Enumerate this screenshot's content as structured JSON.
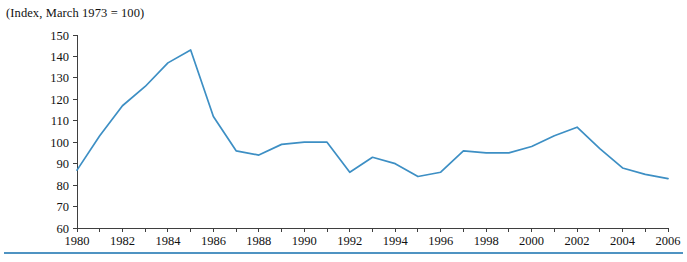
{
  "figure": {
    "title": "(Index, March 1973 = 100)",
    "line_color": "#3d8fc4",
    "rule_color": "#4f93c2",
    "axis_color": "#3f3f3f"
  },
  "chart_data": {
    "type": "line",
    "title": "(Index, March 1973 = 100)",
    "xlabel": "",
    "ylabel": "",
    "xlim": [
      1980,
      2006
    ],
    "ylim": [
      60,
      150
    ],
    "ytick_step": 10,
    "yticks": [
      60,
      70,
      80,
      90,
      100,
      110,
      120,
      130,
      140,
      150
    ],
    "xticks": [
      1980,
      1981,
      1982,
      1983,
      1984,
      1985,
      1986,
      1987,
      1988,
      1989,
      1990,
      1991,
      1992,
      1993,
      1994,
      1995,
      1996,
      1997,
      1998,
      1999,
      2000,
      2001,
      2002,
      2003,
      2004,
      2005,
      2006
    ],
    "xtick_labels": [
      1980,
      1982,
      1984,
      1986,
      1988,
      1990,
      1992,
      1994,
      1996,
      1998,
      2000,
      2002,
      2004,
      2006
    ],
    "grid": false,
    "legend": false,
    "x": [
      1980,
      1981,
      1982,
      1983,
      1984,
      1985,
      1986,
      1987,
      1988,
      1989,
      1990,
      1991,
      1992,
      1993,
      1994,
      1995,
      1996,
      1997,
      1998,
      1999,
      2000,
      2001,
      2002,
      2003,
      2004,
      2005,
      2006
    ],
    "values": [
      87,
      103,
      117,
      126,
      137,
      143,
      112,
      96,
      94,
      99,
      100,
      100,
      86,
      93,
      90,
      84,
      86,
      96,
      95,
      95,
      98,
      103,
      107,
      97,
      88,
      85,
      83
    ],
    "series": [
      {
        "name": "Index",
        "color": "#3d8fc4",
        "values": [
          87,
          103,
          117,
          126,
          137,
          143,
          112,
          96,
          94,
          99,
          100,
          100,
          86,
          93,
          90,
          84,
          86,
          96,
          95,
          95,
          98,
          103,
          107,
          97,
          88,
          85,
          83
        ]
      }
    ]
  }
}
